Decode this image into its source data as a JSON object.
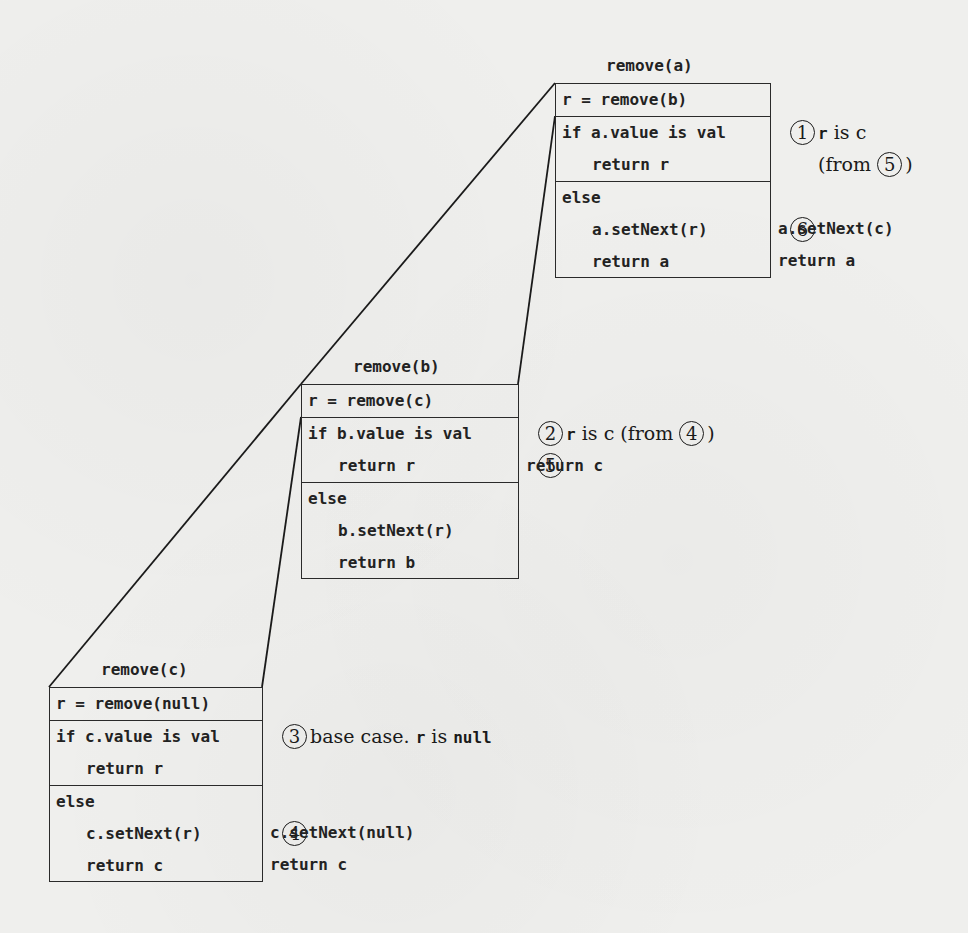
{
  "frames": {
    "a": {
      "title": "remove(a)",
      "call": "r = remove(b)",
      "if_line": "if a.value is val",
      "if_return": "return r",
      "else_line": "else",
      "else_setnext": "a.setNext(r)",
      "else_return": "return a"
    },
    "b": {
      "title": "remove(b)",
      "call": "r = remove(c)",
      "if_line": "if b.value is val",
      "if_return": "return r",
      "else_line": "else",
      "else_setnext": "b.setNext(r)",
      "else_return": "return b"
    },
    "c": {
      "title": "remove(c)",
      "call": "r = remove(null)",
      "if_line": "if c.value is val",
      "if_return": "return r",
      "else_line": "else",
      "else_setnext": "c.setNext(r)",
      "else_return": "return c"
    }
  },
  "annotations": {
    "step1": {
      "num": "1",
      "pre": "r",
      "text": " is c"
    },
    "step1_from": {
      "open": "(from ",
      "num": "5",
      "close": ")"
    },
    "step6": {
      "num": "6"
    },
    "step6_setnext": "a.setNext(c)",
    "step6_return": "return a",
    "step2": {
      "num": "2",
      "pre": "r",
      "text": " is c (from ",
      "ref": "4",
      "close": ")"
    },
    "step5": {
      "num": "5"
    },
    "step5_return": "return c",
    "step3": {
      "num": "3",
      "text": "base case. ",
      "code1": "r",
      "text2": " is ",
      "code2": "null"
    },
    "step4": {
      "num": "4"
    },
    "step4_setnext": "c.setNext(null)",
    "step4_return": "return c"
  },
  "colors": {
    "ink": "#222222",
    "paper": "#efefed"
  }
}
